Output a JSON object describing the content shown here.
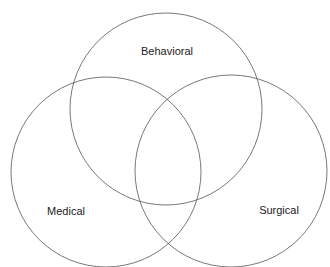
{
  "diagram": {
    "type": "venn",
    "sets": [
      {
        "label": "Behavioral",
        "cx": 166,
        "cy": 109,
        "r": 96,
        "label_x": 167,
        "label_y": 55
      },
      {
        "label": "Medical",
        "cx": 106,
        "cy": 172,
        "r": 95,
        "label_x": 66,
        "label_y": 215
      },
      {
        "label": "Surgical",
        "cx": 231,
        "cy": 171,
        "r": 96,
        "label_x": 279,
        "label_y": 214
      }
    ],
    "stroke_color": "#555555",
    "background": "#ffffff"
  }
}
